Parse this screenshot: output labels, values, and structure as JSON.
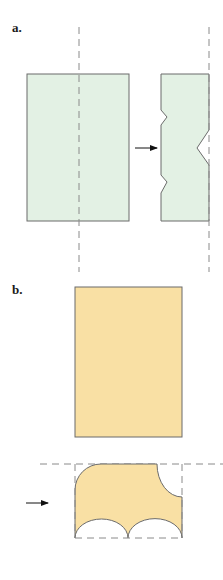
{
  "colors": {
    "panel_a_fill": "#e3f1e4",
    "panel_b_fill": "#f9e0a4",
    "stroke": "#6b6b6b",
    "dash": "#8a8a8a",
    "arrow": "#111111"
  },
  "panels": [
    {
      "label": "a.",
      "description": "Rectangle with vertical dashed fold line, arrow to notched strip with zigzag cutouts"
    },
    {
      "label": "b.",
      "description": "Rectangle, arrow to folded piece with quarter-circle and two semicircle cutouts within dashed boundary"
    }
  ]
}
